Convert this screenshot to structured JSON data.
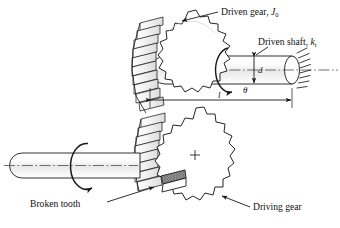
{
  "figure": {
    "background": "#ffffff",
    "line_color": "#1a1a1a",
    "shade_color": "#8d8d8d"
  },
  "labels": {
    "driven_gear": {
      "text": "Driven gear, ",
      "symbol": "J",
      "subscript": "0"
    },
    "driven_shaft": {
      "text": "Driven shaft, ",
      "symbol": "k",
      "subscript": "t"
    },
    "broken_tooth": {
      "text": "Broken tooth"
    },
    "driving_gear": {
      "text": "Driving gear"
    }
  },
  "dimensions": {
    "diameter": {
      "symbol": "d"
    },
    "length": {
      "symbol": "l"
    },
    "twist_angle": {
      "symbol": "θ"
    }
  },
  "components": {
    "driven_gear": {
      "name": "driven-gear",
      "teeth": 18
    },
    "driving_gear": {
      "name": "driving-gear",
      "teeth": 18
    },
    "driven_shaft": {
      "name": "driven-shaft"
    },
    "driving_shaft": {
      "name": "driving-shaft"
    },
    "fixed_support": {
      "name": "fixed-end-support"
    },
    "broken_tooth_marker": {
      "name": "broken-tooth"
    }
  }
}
